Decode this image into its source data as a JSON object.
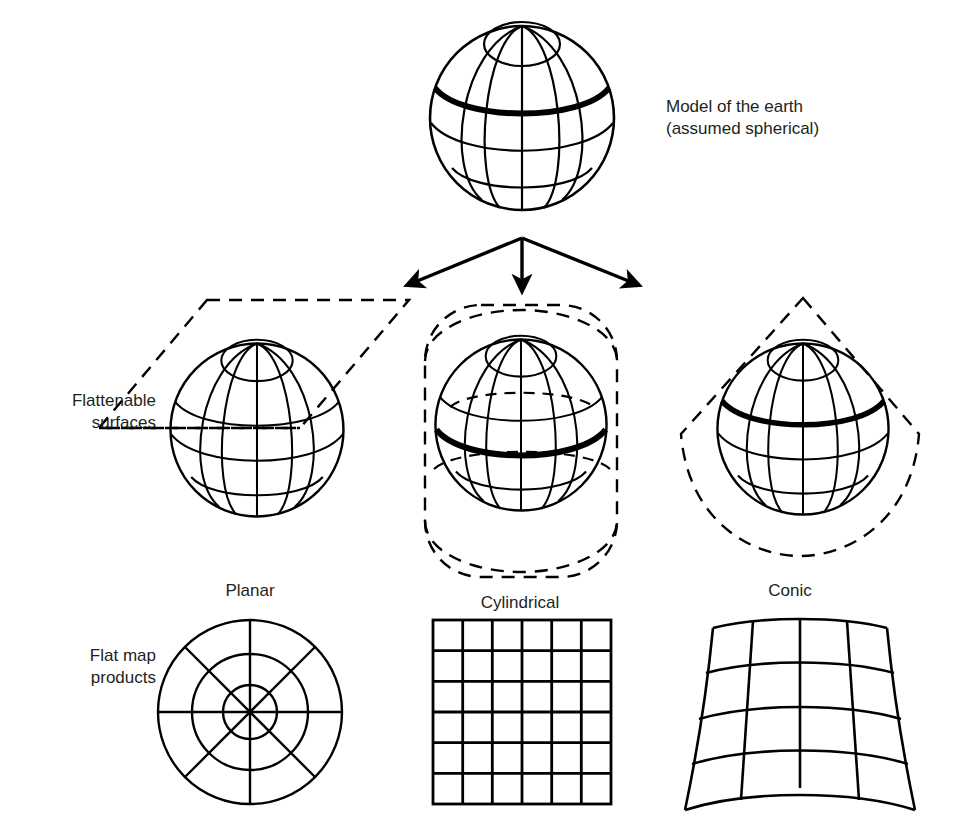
{
  "diagram": {
    "title_note": "Map projection surfaces diagram",
    "root": {
      "label_line1": "Model of the earth",
      "label_line2": "(assumed spherical)",
      "label_full": "Model of the earth\n(assumed spherical)"
    },
    "row_labels": {
      "flattenable": "Flattenable\nsurfaces",
      "flat_map": "Flat map\nproducts"
    },
    "branches": [
      {
        "key": "planar",
        "label": "Planar",
        "surface": "tangent plane (parallelogram)",
        "flat_product": "polar azimuthal grid: 3 concentric circles, 8 radial spokes"
      },
      {
        "key": "cylindrical",
        "label": "Cylindrical",
        "surface": "cylinder (rounded rectangle)",
        "flat_product": "rectangular 6 x 6 graticule grid"
      },
      {
        "key": "conic",
        "label": "Conic",
        "surface": "cone (triangle with curved base)",
        "flat_product": "fan-shaped grid: 4 curved rows, 4 columns"
      }
    ],
    "colors": {
      "ink": "#000000",
      "text": "#231f20",
      "background": "#ffffff"
    },
    "arrows": {
      "count": 3,
      "origin_label": "globe base",
      "directions": [
        "left",
        "down",
        "right"
      ]
    }
  }
}
